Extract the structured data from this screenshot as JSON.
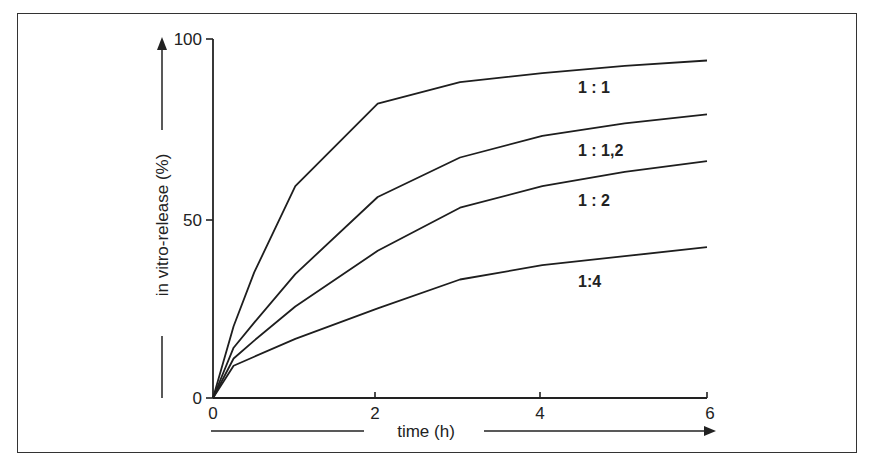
{
  "chart_data": {
    "type": "line",
    "title": "",
    "xlabel": "time (h)",
    "ylabel": "in vitro-release (%)",
    "xlim": [
      0,
      6
    ],
    "ylim": [
      0,
      100
    ],
    "x_ticks": [
      "0",
      "2",
      "4",
      "6"
    ],
    "y_ticks": [
      "0",
      "50",
      "100"
    ],
    "grid": false,
    "legend": "inline labels next to curves",
    "x": [
      0,
      0.25,
      0.5,
      1,
      2,
      3,
      4,
      5,
      6
    ],
    "series": [
      {
        "name": "1:1",
        "label": "1 : 1",
        "values": [
          0,
          20,
          35,
          59,
          82,
          88,
          90.5,
          92.5,
          94
        ]
      },
      {
        "name": "1:1,2",
        "label": "1 : 1,2",
        "values": [
          0,
          14,
          21,
          34.5,
          56,
          67,
          73,
          76.5,
          79
        ]
      },
      {
        "name": "1:2",
        "label": "1 : 2",
        "values": [
          0,
          11,
          16,
          25.5,
          41,
          53,
          59,
          63,
          66
        ]
      },
      {
        "name": "1:4",
        "label": "1:4",
        "values": [
          0,
          9,
          11.5,
          16.5,
          25,
          33,
          37,
          39.5,
          42
        ]
      }
    ]
  }
}
